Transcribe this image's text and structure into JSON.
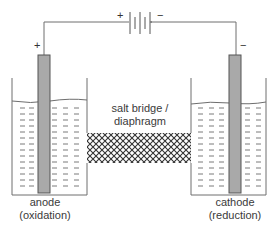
{
  "diagram": {
    "type": "electrolytic-cell",
    "colors": {
      "line": "#6e6e6e",
      "electrode_fill": "#a9a9a9",
      "electrode_stroke": "#555555",
      "hatch": "#333333",
      "text": "#3a3a3a",
      "background": "#ffffff"
    },
    "battery": {
      "plus_label": "+",
      "minus_label": "−"
    },
    "left_electrode": {
      "sign": "+",
      "name": "anode",
      "process": "(oxidation)"
    },
    "right_electrode": {
      "sign": "−",
      "name": "cathode",
      "process": "(reduction)"
    },
    "salt_bridge": {
      "line1": "salt bridge /",
      "line2": "diaphragm"
    }
  }
}
